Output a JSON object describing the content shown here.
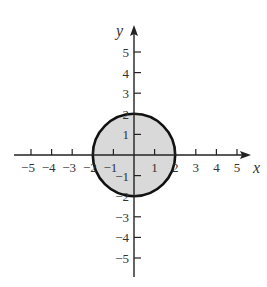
{
  "chart_data": {
    "type": "scatter",
    "title": "",
    "xlabel": "x",
    "ylabel": "y",
    "xlim": [
      -5.5,
      6
    ],
    "ylim": [
      -6,
      6
    ],
    "grid": false,
    "x_ticks": [
      -5,
      -4,
      -3,
      -2,
      -1,
      1,
      2,
      3,
      4,
      5
    ],
    "y_ticks": [
      5,
      4,
      3,
      2,
      1,
      -1,
      -2,
      -3,
      -4,
      -5
    ],
    "x_tick_labels": [
      "−5",
      "−4",
      "−3",
      "−2",
      "−1",
      "1",
      "2",
      "3",
      "4",
      "5"
    ],
    "y_tick_labels": [
      "5",
      "4",
      "3",
      "2",
      "1",
      "−1",
      "−2",
      "−3",
      "−4",
      "−5"
    ],
    "shapes": [
      {
        "kind": "circle",
        "center": [
          0,
          0
        ],
        "radius": 2,
        "filled": true,
        "fill_color": "#d9d9d9",
        "stroke_color": "#111111",
        "equation": "x^2 + y^2 <= 4"
      }
    ]
  },
  "colors": {
    "axis": "#222222",
    "circle_stroke": "#111111",
    "circle_fill": "#d9d9d9",
    "text": "#333333"
  }
}
